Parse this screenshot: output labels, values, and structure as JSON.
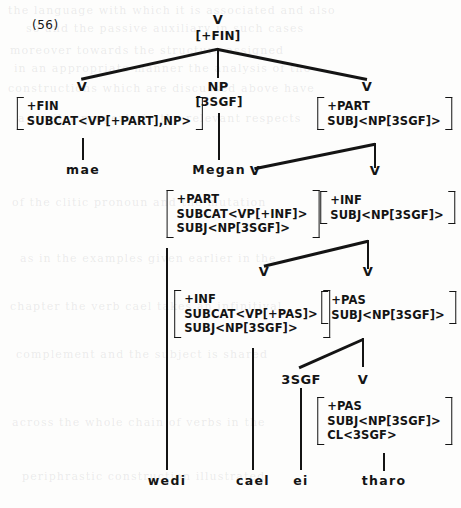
{
  "figure": {
    "example_number": "(56)",
    "language": "Welsh",
    "sentence_words": [
      "mae",
      "Megan",
      "wedi",
      "cael",
      "ei",
      "tharo"
    ]
  },
  "nodes": {
    "root": {
      "cat": "V",
      "feat": "[+FIN]"
    },
    "v_mae": {
      "cat": "V"
    },
    "np_megan": {
      "cat": "NP",
      "feat": "[3SGF]"
    },
    "v_part": {
      "cat": "V"
    },
    "v_wedi": {
      "cat": "V"
    },
    "v_inf_top": {
      "cat": "V"
    },
    "v_cael": {
      "cat": "V"
    },
    "v_pas_top": {
      "cat": "V"
    },
    "n_3sgf": {
      "cat": "3SGF"
    },
    "v_tharo": {
      "cat": "V"
    }
  },
  "matrices": {
    "mae": {
      "name": "avm-mae",
      "rows": [
        "+FIN",
        "SUBCAT<VP[+PART],NP>"
      ]
    },
    "part": {
      "name": "avm-part",
      "rows": [
        "+PART",
        "SUBJ<NP[3SGF]>"
      ]
    },
    "wedi": {
      "name": "avm-wedi",
      "rows": [
        "+PART",
        "SUBCAT<VP[+INF]>",
        "SUBJ<NP[3SGF]>"
      ]
    },
    "inf_top": {
      "name": "avm-inf-top",
      "rows": [
        "+INF",
        "SUBJ<NP[3SGF]>"
      ]
    },
    "cael": {
      "name": "avm-cael",
      "rows": [
        "+INF",
        "SUBCAT<VP[+PAS]>",
        "SUBJ<NP[3SGF]>"
      ]
    },
    "pas_top": {
      "name": "avm-pas-top",
      "rows": [
        "+PAS",
        "SUBJ<NP[3SGF]>"
      ]
    },
    "tharo": {
      "name": "avm-tharo",
      "rows": [
        "+PAS",
        "SUBJ<NP[3SGF]>",
        "CL<3SGF>"
      ]
    }
  },
  "leaves": {
    "mae": "mae",
    "megan": "Megan",
    "wedi": "wedi",
    "cael": "cael",
    "ei": "ei",
    "tharo": "tharo"
  },
  "bleed_lines": [
    "the language with which it is associated and also",
    "so and the passive auxiliary in such cases",
    "moreover towards the structure assigned",
    "in an appropriate manner the analysis of the",
    "constructions which are discussed above have",
    "a similar property in the relevant respects",
    "of the clitic pronoun and the mutation",
    "as in the examples given earlier in the",
    "chapter the verb cael takes an infinitival",
    "complement and the subject is shared",
    "across the whole chain of verbs in the",
    "periphrastic construction illustrated"
  ],
  "colors": {
    "ink": "#141414",
    "paper": "#fdfdfc"
  }
}
